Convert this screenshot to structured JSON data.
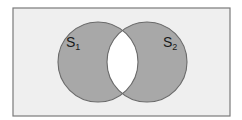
{
  "diagram": {
    "type": "venn",
    "universe": {
      "x": 13,
      "y": 8,
      "width": 217,
      "height": 108,
      "fill": "#efefef",
      "stroke": "#7a7a7a"
    },
    "sets": [
      {
        "id": "S1",
        "base": "S",
        "subscript": "1",
        "cx": 98,
        "cy": 62,
        "r": 40,
        "label_x": 66,
        "label_y": 47
      },
      {
        "id": "S2",
        "base": "S",
        "subscript": "2",
        "cx": 147,
        "cy": 62,
        "r": 40,
        "label_x": 163,
        "label_y": 47
      }
    ],
    "colors": {
      "shaded": "#a8a8a8",
      "circle_stroke": "#6a6a6a",
      "intersection": "#ffffff"
    },
    "shaded_region": "S1 xor S2 (intersection unshaded)"
  }
}
